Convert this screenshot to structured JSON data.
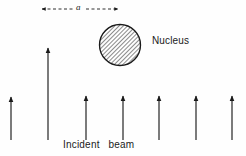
{
  "figure": {
    "background_color": "#fefefe",
    "ink_color": "#1a1a1a",
    "width": 246,
    "height": 156
  },
  "labels": {
    "nucleus": "Nucleus",
    "incident_beam": "Incident   beam",
    "impact_parameter": "a"
  },
  "nucleus": {
    "name": "nucleus",
    "center_x": 120,
    "center_y": 45,
    "radius": 21,
    "fill_pattern": "diagonal-hatch",
    "hatch_angle_deg": 45,
    "hatch_spacing_px": 2,
    "stroke_color": "#1a1a1a",
    "stroke_width": 1.3
  },
  "impact_dimension": {
    "name": "impact-parameter-dimension",
    "y": 9,
    "x_start": 41,
    "x_end": 119,
    "style": "dashed-double-arrow",
    "dash_pattern": "3,2.5",
    "label": "a"
  },
  "beam_arrows": {
    "color": "#1a1a1a",
    "stroke_width": 1.1,
    "head_width": 4.4,
    "head_length": 7,
    "items": [
      {
        "name": "beam-arrow-1",
        "x": 11,
        "y_tail": 140,
        "y_head": 96,
        "height": 44,
        "kind": "short"
      },
      {
        "name": "beam-arrow-2",
        "x": 48,
        "y_tail": 140,
        "y_head": 46,
        "height": 94,
        "kind": "tall"
      },
      {
        "name": "beam-arrow-3",
        "x": 86,
        "y_tail": 140,
        "y_head": 95,
        "height": 45,
        "kind": "short"
      },
      {
        "name": "beam-arrow-4",
        "x": 123,
        "y_tail": 140,
        "y_head": 95,
        "height": 45,
        "kind": "short"
      },
      {
        "name": "beam-arrow-5",
        "x": 159,
        "y_tail": 140,
        "y_head": 95,
        "height": 45,
        "kind": "short"
      },
      {
        "name": "beam-arrow-6",
        "x": 196,
        "y_tail": 140,
        "y_head": 95,
        "height": 45,
        "kind": "short"
      },
      {
        "name": "beam-arrow-7",
        "x": 232,
        "y_tail": 140,
        "y_head": 95,
        "height": 45,
        "kind": "short"
      }
    ]
  }
}
